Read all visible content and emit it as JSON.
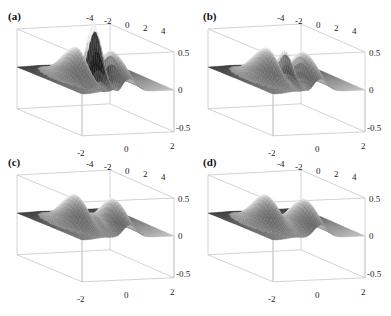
{
  "chart_data": [
    {
      "type": "surface3d",
      "panel_label": "(a)",
      "description": "3D surface: two Gaussian humps on a flat z=0 plane with a strong central oscillating interference pattern (tall spikes above and below the plane)",
      "x_ticks": [
        "-4",
        "-2",
        "0",
        "2",
        "4"
      ],
      "y_ticks": [
        "-2",
        "0",
        "2"
      ],
      "z_ticks": [
        "0.5",
        "0",
        "-0.5"
      ],
      "z_range": [
        -0.5,
        0.5
      ],
      "central_feature": "large oscillation",
      "central_amplitude": 0.65
    },
    {
      "type": "surface3d",
      "panel_label": "(b)",
      "description": "Two Gaussian humps with a moderate central oscillating feature",
      "x_ticks": [
        "-4",
        "-2",
        "0",
        "2",
        "4"
      ],
      "y_ticks": [
        "-2",
        "0",
        "2"
      ],
      "z_ticks": [
        "0.5",
        "0",
        "-0.5"
      ],
      "z_range": [
        -0.5,
        0.5
      ],
      "central_feature": "moderate oscillation",
      "central_amplitude": 0.3
    },
    {
      "type": "surface3d",
      "panel_label": "(c)",
      "description": "Two Gaussian humps with a small residual central ripple",
      "x_ticks": [
        "-4",
        "-2",
        "0",
        "2",
        "4"
      ],
      "y_ticks": [
        "-2",
        "0",
        "2"
      ],
      "z_ticks": [
        "0.5",
        "0",
        "-0.5"
      ],
      "z_range": [
        -0.5,
        0.5
      ],
      "central_feature": "small ripple",
      "central_amplitude": 0.08
    },
    {
      "type": "surface3d",
      "panel_label": "(d)",
      "description": "Two separated Gaussian humps with no central feature",
      "x_ticks": [
        "-4",
        "-2",
        "0",
        "2",
        "4"
      ],
      "y_ticks": [
        "-2",
        "0",
        "2"
      ],
      "z_ticks": [
        "0.5",
        "0",
        "-0.5"
      ],
      "z_range": [
        -0.5,
        0.5
      ],
      "central_feature": "none",
      "central_amplitude": 0
    }
  ],
  "panels": [
    {
      "label": "(a)"
    },
    {
      "label": "(b)"
    },
    {
      "label": "(c)"
    },
    {
      "label": "(d)"
    }
  ],
  "axes": {
    "x_ticks": [
      "-4",
      "-2",
      "0",
      "2",
      "4"
    ],
    "y_ticks": [
      "-2",
      "0",
      "2"
    ],
    "z_ticks": [
      "0.5",
      "0",
      "-0.5"
    ]
  },
  "colors": {
    "box_line": "#c8c8c8",
    "surface_light": "#eeeeee",
    "surface_dark": "#3a3a3a",
    "text": "#222222"
  }
}
